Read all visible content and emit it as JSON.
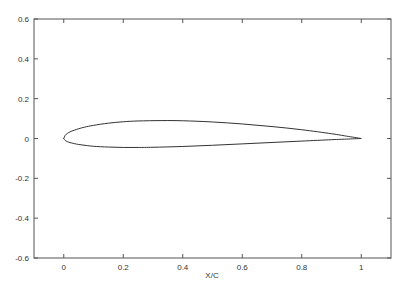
{
  "chart_data": {
    "type": "line",
    "title": "",
    "xlabel": "X/C",
    "ylabel": "",
    "xlim": [
      -0.1,
      1.1
    ],
    "ylim": [
      -0.6,
      0.6
    ],
    "grid": false,
    "legend": null,
    "x_ticks": [
      "0",
      "0.2",
      "0.4",
      "0.6",
      "0.8",
      "1"
    ],
    "y_ticks": [
      "0.6",
      "0.4",
      "0.2",
      "0",
      "-0.2",
      "-0.4",
      "-0.6"
    ],
    "series": [
      {
        "name": "upper surface",
        "x": [
          1.0,
          0.95,
          0.9,
          0.8,
          0.7,
          0.6,
          0.5,
          0.4,
          0.33,
          0.25,
          0.2,
          0.15,
          0.1,
          0.07,
          0.05,
          0.025,
          0.0125,
          0.005,
          0.0
        ],
        "y": [
          0.0,
          0.012,
          0.024,
          0.044,
          0.06,
          0.073,
          0.083,
          0.089,
          0.09,
          0.088,
          0.084,
          0.077,
          0.066,
          0.057,
          0.049,
          0.036,
          0.026,
          0.016,
          0.0
        ]
      },
      {
        "name": "lower surface",
        "x": [
          0.0,
          0.005,
          0.0125,
          0.025,
          0.05,
          0.075,
          0.1,
          0.15,
          0.2,
          0.25,
          0.3,
          0.4,
          0.5,
          0.6,
          0.7,
          0.8,
          0.9,
          0.95,
          1.0
        ],
        "y": [
          0.0,
          -0.01,
          -0.016,
          -0.022,
          -0.03,
          -0.035,
          -0.039,
          -0.043,
          -0.045,
          -0.045,
          -0.044,
          -0.04,
          -0.034,
          -0.027,
          -0.02,
          -0.013,
          -0.006,
          -0.003,
          0.0
        ]
      }
    ]
  }
}
